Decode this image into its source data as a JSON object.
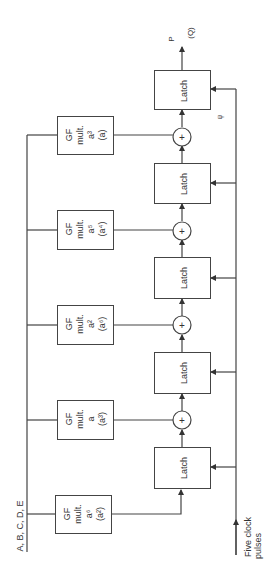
{
  "bus_label": "A, B, C, D, E",
  "clock_label": [
    "Five clock",
    "pulses"
  ],
  "output_labels": {
    "p": "P",
    "q": "(Q)"
  },
  "small_mark": "ψ",
  "latch_label": "Latch",
  "gf_boxes": [
    {
      "line1": "GF",
      "line2": "mult.",
      "coef": "a³",
      "alt": "(a)"
    },
    {
      "line1": "GF",
      "line2": "mult.",
      "coef": "a⁵",
      "alt": "(a⁴)"
    },
    {
      "line1": "GF",
      "line2": "mult.",
      "coef": "a²",
      "alt": "(a⁶)"
    },
    {
      "line1": "GF",
      "line2": "mult.",
      "coef": "a",
      "alt": "(a³)"
    },
    {
      "line1": "GF",
      "line2": "mult.",
      "coef": "a⁶",
      "alt": "(a²)"
    }
  ],
  "latches": [
    "Latch",
    "Latch",
    "Latch",
    "Latch",
    "Latch"
  ],
  "adder_symbol": "+"
}
